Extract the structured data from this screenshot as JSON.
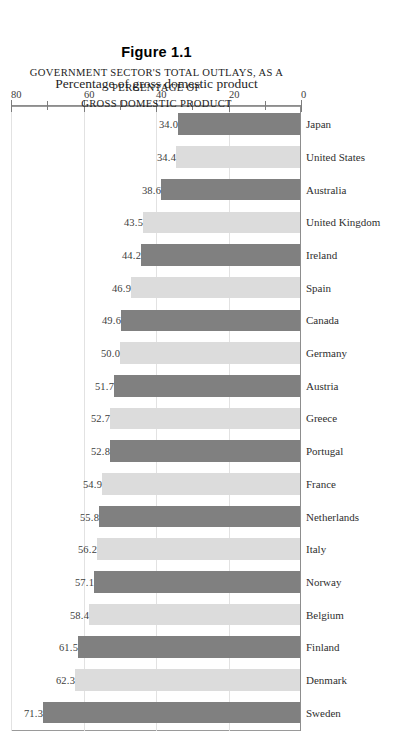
{
  "figure": {
    "number": "Figure 1.1",
    "caption_line1": "GOVERNMENT SECTOR'S TOTAL OUTLAYS, AS A PERCENTAGE OF",
    "caption_line2": "GROSS DOMESTIC PRODUCT"
  },
  "axis": {
    "y_title": "Percentage of gross domestic product",
    "ticks": [
      "0",
      "20",
      "40",
      "60",
      "80"
    ]
  },
  "colors": {
    "bar_dark": "#808080",
    "bar_light": "#dcdcdc",
    "frame": "#9a9a9a",
    "gridline": "#e2e2e2",
    "background": "#ffffff"
  },
  "chart_data": {
    "type": "bar",
    "title": "Figure 1.1",
    "subtitle": "GOVERNMENT SECTOR'S TOTAL OUTLAYS, AS A PERCENTAGE OF GROSS DOMESTIC PRODUCT",
    "xlabel": "",
    "ylabel": "Percentage of gross domestic product",
    "ylim": [
      0,
      80
    ],
    "yticks": [
      0,
      20,
      40,
      60,
      80
    ],
    "minor_yticks": [
      10,
      30,
      50,
      70
    ],
    "grid": true,
    "legend": null,
    "orientation": "vertical",
    "categories": [
      "Sweden",
      "Denmark",
      "Finland",
      "Belgium",
      "Norway",
      "Italy",
      "Netherlands",
      "France",
      "Portugal",
      "Greece",
      "Austria",
      "Germany",
      "Canada",
      "Spain",
      "Ireland",
      "United Kingdom",
      "Australia",
      "United States",
      "Japan"
    ],
    "values": [
      71.3,
      62.3,
      61.5,
      58.4,
      57.1,
      56.2,
      55.8,
      54.9,
      52.8,
      52.7,
      51.7,
      50.0,
      49.6,
      46.9,
      44.2,
      43.5,
      38.6,
      34.4,
      34.0
    ],
    "value_labels": [
      "71.3",
      "62.3",
      "61.5",
      "58.4",
      "57.1",
      "56.2",
      "55.8",
      "54.9",
      "52.8",
      "52.7",
      "51.7",
      "50.0",
      "49.6",
      "46.9",
      "44.2",
      "43.5",
      "38.6",
      "34.4",
      "34.0"
    ],
    "bar_shades": [
      "dark",
      "light",
      "dark",
      "light",
      "dark",
      "light",
      "dark",
      "light",
      "dark",
      "light",
      "dark",
      "light",
      "dark",
      "light",
      "dark",
      "light",
      "dark",
      "light",
      "dark"
    ]
  }
}
